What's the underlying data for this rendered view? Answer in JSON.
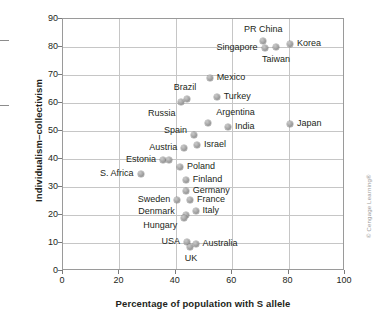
{
  "chart_data": {
    "type": "scatter",
    "title": "",
    "xlabel": "Percentage of population with S allele",
    "ylabel": "Individualism–collectivism",
    "xlim": [
      0,
      100
    ],
    "ylim": [
      0,
      90
    ],
    "xticks": [
      0,
      20,
      40,
      60,
      80,
      100
    ],
    "yticks": [
      0,
      10,
      20,
      30,
      40,
      50,
      60,
      70,
      80,
      90
    ],
    "grid": true,
    "legend": "none",
    "points": [
      {
        "label": "PR China",
        "x": 71.0,
        "y": 82.0,
        "label_pos": "above",
        "label_dx": 0,
        "label_dy": -11
      },
      {
        "label": "Singapore",
        "x": 71.5,
        "y": 79.5,
        "label_pos": "left",
        "label_dx": -7,
        "label_dy": 0
      },
      {
        "label": "Korea",
        "x": 80.5,
        "y": 81.0,
        "label_pos": "right",
        "label_dx": 7,
        "label_dy": 0
      },
      {
        "label": "Taiwan",
        "x": 75.5,
        "y": 80.0,
        "label_pos": "below",
        "label_dx": 0,
        "label_dy": 13
      },
      {
        "label": "Mexico",
        "x": 52.0,
        "y": 69.0,
        "label_pos": "right",
        "label_dx": 7,
        "label_dy": 0
      },
      {
        "label": "Brazil",
        "x": 44.0,
        "y": 61.5,
        "label_pos": "above",
        "label_dx": -2,
        "label_dy": -11
      },
      {
        "label": "Russia",
        "x": 42.0,
        "y": 60.5,
        "label_pos": "below-left",
        "label_dx": -6,
        "label_dy": 12
      },
      {
        "label": "Turkey",
        "x": 54.5,
        "y": 62.0,
        "label_pos": "right",
        "label_dx": 7,
        "label_dy": 0
      },
      {
        "label": "Argentina",
        "x": 51.5,
        "y": 53.0,
        "label_pos": "above-right",
        "label_dx": 8,
        "label_dy": -10
      },
      {
        "label": "India",
        "x": 58.5,
        "y": 51.5,
        "label_pos": "right",
        "label_dx": 7,
        "label_dy": 0
      },
      {
        "label": "Japan",
        "x": 80.5,
        "y": 52.5,
        "label_pos": "right",
        "label_dx": 7,
        "label_dy": 0
      },
      {
        "label": "Spain",
        "x": 46.5,
        "y": 48.5,
        "label_pos": "left",
        "label_dx": -7,
        "label_dy": -4
      },
      {
        "label": "Israel",
        "x": 47.5,
        "y": 45.0,
        "label_pos": "right",
        "label_dx": 7,
        "label_dy": 0
      },
      {
        "label": "Austria",
        "x": 43.0,
        "y": 44.0,
        "label_pos": "left",
        "label_dx": -7,
        "label_dy": 0
      },
      {
        "label": "Estonia",
        "x": 35.5,
        "y": 39.5,
        "label_pos": "left",
        "label_dx": -7,
        "label_dy": 0
      },
      {
        "label": "",
        "x": 37.5,
        "y": 39.5,
        "label_pos": "none",
        "label_dx": 0,
        "label_dy": 0
      },
      {
        "label": "S. Africa",
        "x": 27.5,
        "y": 34.5,
        "label_pos": "left",
        "label_dx": -7,
        "label_dy": 0
      },
      {
        "label": "Poland",
        "x": 41.5,
        "y": 37.0,
        "label_pos": "right",
        "label_dx": 7,
        "label_dy": 0
      },
      {
        "label": "Finland",
        "x": 43.5,
        "y": 32.5,
        "label_pos": "right",
        "label_dx": 7,
        "label_dy": 0
      },
      {
        "label": "Germany",
        "x": 43.5,
        "y": 28.5,
        "label_pos": "right",
        "label_dx": 7,
        "label_dy": 0
      },
      {
        "label": "Sweden",
        "x": 40.5,
        "y": 25.5,
        "label_pos": "left",
        "label_dx": -7,
        "label_dy": 0
      },
      {
        "label": "France",
        "x": 45.0,
        "y": 25.5,
        "label_pos": "right",
        "label_dx": 7,
        "label_dy": 0
      },
      {
        "label": "Italy",
        "x": 47.0,
        "y": 21.5,
        "label_pos": "right",
        "label_dx": 7,
        "label_dy": 0
      },
      {
        "label": "Denmark",
        "x": 43.5,
        "y": 20.0,
        "label_pos": "left",
        "label_dx": -11,
        "label_dy": -3
      },
      {
        "label": "Hungary",
        "x": 43.0,
        "y": 19.0,
        "label_pos": "below-left",
        "label_dx": -7,
        "label_dy": 8
      },
      {
        "label": "USA",
        "x": 44.0,
        "y": 10.5,
        "label_pos": "left",
        "label_dx": -7,
        "label_dy": 0
      },
      {
        "label": "UK",
        "x": 45.0,
        "y": 8.5,
        "label_pos": "below",
        "label_dx": 1,
        "label_dy": 12
      },
      {
        "label": "Australia",
        "x": 47.0,
        "y": 9.5,
        "label_pos": "right",
        "label_dx": 7,
        "label_dy": 0
      }
    ]
  },
  "copyright": "© Cengage Learning®"
}
